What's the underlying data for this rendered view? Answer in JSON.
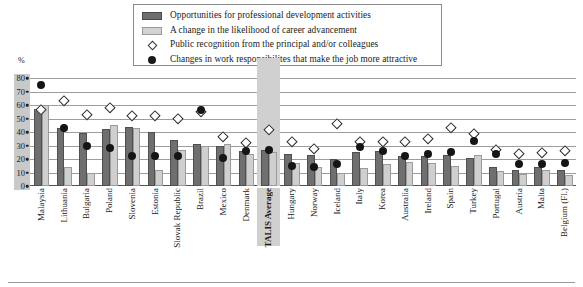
{
  "axis": {
    "y_unit": "%",
    "ticks": [
      "80",
      "70",
      "60",
      "50",
      "40",
      "30",
      "20",
      "10",
      "0"
    ],
    "ymin": 0,
    "ymax": 80
  },
  "legend": {
    "items": [
      {
        "label": "Opportunities for professional development activities",
        "marker": "bar-dark-swatch",
        "color": "#6e6e6e"
      },
      {
        "label": "A change in the likelihood of career advancement",
        "marker": "bar-light-swatch",
        "color": "#d2d2d2"
      },
      {
        "label": "Public recognition from the principal and/or colleagues",
        "marker": "open-diamond-marker",
        "color": "#ffffff"
      },
      {
        "label": "Changes in work responsibilites that make the job more attractive",
        "marker": "filled-circle-marker",
        "color": "#1b1b1b"
      }
    ]
  },
  "highlight": {
    "category": "TALIS Average",
    "color": "#d0d0d0"
  },
  "chart_data": {
    "type": "bar",
    "title": "",
    "xlabel": "",
    "ylabel": "%",
    "ylim": [
      0,
      80
    ],
    "grid": true,
    "legend_position": "top",
    "categories": [
      "Malaysia",
      "Lithuania",
      "Bulgaria",
      "Poland",
      "Slovenia",
      "Estonia",
      "Slovak Republic",
      "Brazil",
      "Mexico",
      "Denmark",
      "TALIS Average",
      "Hungary",
      "Norway",
      "Iceland",
      "Italy",
      "Korea",
      "Australia",
      "Ireland",
      "Spain",
      "Turkey",
      "Portugal",
      "Austria",
      "Malta",
      "Belgium (Fl.)"
    ],
    "series": [
      {
        "name": "Opportunities for professional development activities",
        "type": "bar",
        "color": "#6f6f6f",
        "values": [
          57,
          43,
          39,
          42,
          44,
          40,
          34,
          31,
          30,
          26,
          27,
          24,
          23,
          20,
          25,
          26,
          22,
          22,
          23,
          21,
          14,
          12,
          14,
          12
        ]
      },
      {
        "name": "A change in the likelihood of career advancement",
        "type": "bar",
        "color": "#cfcfcf",
        "values": [
          60,
          14,
          10,
          45,
          43,
          12,
          27,
          30,
          31,
          24,
          25,
          17,
          14,
          10,
          13,
          16,
          18,
          17,
          15,
          23,
          11,
          9,
          12,
          8
        ]
      },
      {
        "name": "Public recognition from the principal and/or colleagues",
        "type": "marker",
        "marker": "open-diamond",
        "color": "#ffffff",
        "values": [
          57,
          63,
          53,
          58,
          52,
          52,
          50,
          55,
          37,
          32,
          42,
          33,
          28,
          46,
          33,
          33,
          33,
          35,
          43,
          39,
          27,
          24,
          25,
          26
        ]
      },
      {
        "name": "Changes in work responsibilites that make the job more attractive",
        "type": "marker",
        "marker": "filled-circle",
        "color": "#151515",
        "values": [
          75,
          43,
          30,
          28,
          22,
          22,
          22,
          56,
          21,
          26,
          27,
          15,
          14,
          16,
          29,
          26,
          22,
          24,
          25,
          33,
          24,
          16,
          16,
          17
        ]
      }
    ]
  }
}
